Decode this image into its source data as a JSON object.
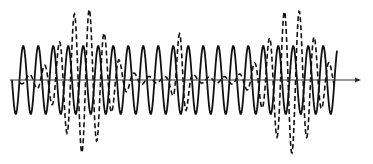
{
  "diagram": {
    "type": "wave-interference",
    "axis": {
      "x_start": 10,
      "x_end": 358,
      "y": 80,
      "color": "#333333",
      "arrow": true
    },
    "solid_wave": {
      "name": "reference-wave",
      "style": "solid",
      "color": "#111111",
      "x_start": 12,
      "x_end": 337,
      "period_px": 15,
      "amplitude_px": 34,
      "phase": "starts-downward"
    },
    "dashed_wave": {
      "name": "beating-wave",
      "style": "dashed",
      "color": "#111111",
      "x_start": 20,
      "x_end": 335,
      "period_px": 15,
      "bursts": [
        {
          "center_x": 84,
          "amplitude_px": 70,
          "width_px": 70
        },
        {
          "center_x": 181,
          "amplitude_px": 45,
          "width_px": 18
        },
        {
          "center_x": 292,
          "amplitude_px": 70,
          "width_px": 70
        }
      ]
    }
  }
}
